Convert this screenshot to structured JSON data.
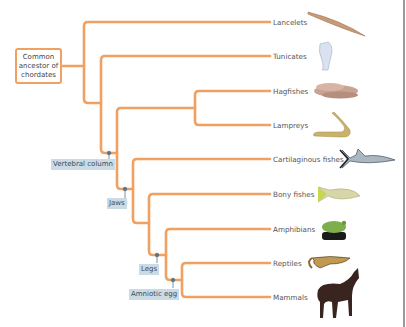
{
  "diagram": {
    "type": "cladogram",
    "root": {
      "label": "Common ancestor of chordates",
      "lines": [
        "Common",
        "ancestor of",
        "chordates"
      ]
    },
    "branch_color": "#f0a060",
    "trait_label_bg": "#cbdbe5",
    "node_color": "#5b7383",
    "taxa": [
      {
        "id": "lancelets",
        "label": "Lancelets",
        "icon": "lancelet-icon"
      },
      {
        "id": "tunicates",
        "label": "Tunicates",
        "icon": "tunicate-icon"
      },
      {
        "id": "hagfishes",
        "label": "Hagfishes",
        "icon": "hagfish-icon"
      },
      {
        "id": "lampreys",
        "label": "Lampreys",
        "icon": "lamprey-icon"
      },
      {
        "id": "cartilaginous",
        "label": "Cartilaginous fishes",
        "icon": "shark-icon"
      },
      {
        "id": "bony",
        "label": "Bony fishes",
        "icon": "bony-fish-icon"
      },
      {
        "id": "amphibians",
        "label": "Amphibians",
        "icon": "frog-icon"
      },
      {
        "id": "reptiles",
        "label": "Reptiles",
        "icon": "lizard-icon"
      },
      {
        "id": "mammals",
        "label": "Mammals",
        "icon": "horse-icon"
      }
    ],
    "traits": [
      {
        "id": "vertebral",
        "label": "Vertebral column"
      },
      {
        "id": "jaws",
        "label": "Jaws"
      },
      {
        "id": "legs",
        "label": "Legs"
      },
      {
        "id": "amniotic",
        "label": "Amniotic egg"
      }
    ]
  }
}
